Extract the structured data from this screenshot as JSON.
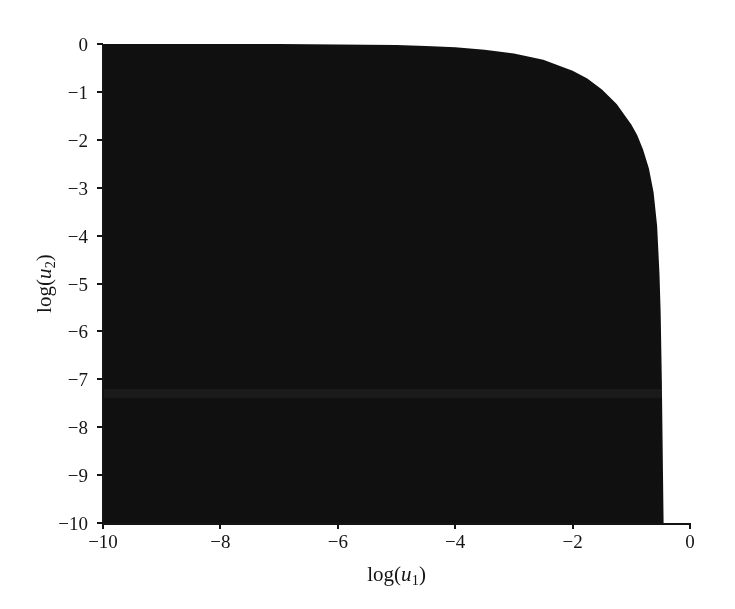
{
  "figure": {
    "background_color": "#ffffff",
    "fill_color": "#0d0d0d",
    "axis_color": "#141414",
    "appearance": "scanned-halftone"
  },
  "axes": {
    "x": {
      "label_prefix": "log(",
      "label_var": "u",
      "label_sub": "1",
      "label_suffix": ")",
      "label_text": "log(u1)",
      "min": -10,
      "max": 0,
      "ticks": [
        -10,
        -8,
        -6,
        -4,
        -2,
        0
      ],
      "tick_labels": [
        "−10",
        "−8",
        "−6",
        "−4",
        "−2",
        "0"
      ]
    },
    "y": {
      "label_prefix": "log(",
      "label_var": "u",
      "label_sub": "2",
      "label_suffix": ")",
      "label_text": "log(u2)",
      "min": -10,
      "max": 0,
      "ticks": [
        0,
        -1,
        -2,
        -3,
        -4,
        -5,
        -6,
        -7,
        -8,
        -9,
        -10
      ],
      "tick_labels": [
        "0",
        "−1",
        "−2",
        "−3",
        "−4",
        "−5",
        "−6",
        "−7",
        "−8",
        "−9",
        "−10"
      ]
    }
  },
  "chart_data": {
    "type": "area",
    "title": "",
    "subtitle": "",
    "xlabel": "log(u1)",
    "ylabel": "log(u2)",
    "xlim": [
      -10,
      0
    ],
    "ylim": [
      -10,
      0
    ],
    "grid": false,
    "legend": null,
    "annotations": [],
    "series": [
      {
        "name": "shaded region",
        "kind": "filled-region",
        "fill": "#0d0d0d",
        "description": "Solid black region occupying the lower-left of the square domain, bounded above and to the right by a convex decreasing boundary curve; the region covers essentially the whole panel except a small wedge in the upper-right corner.",
        "boundary_x": [
          -10.0,
          -9.0,
          -8.0,
          -7.0,
          -6.0,
          -5.0,
          -4.5,
          -4.0,
          -3.5,
          -3.0,
          -2.5,
          -2.0,
          -1.75,
          -1.5,
          -1.25,
          -1.0,
          -0.9,
          -0.8,
          -0.7,
          -0.62,
          -0.56,
          -0.52,
          -0.5,
          -0.48,
          -0.46,
          -0.45
        ],
        "boundary_y": [
          0.0,
          0.0,
          0.0,
          0.0,
          -0.01,
          -0.02,
          -0.04,
          -0.07,
          -0.12,
          -0.2,
          -0.33,
          -0.56,
          -0.72,
          -0.95,
          -1.25,
          -1.68,
          -1.9,
          -2.2,
          -2.6,
          -3.1,
          -3.8,
          -4.8,
          -5.6,
          -7.0,
          -9.0,
          -10.0
        ],
        "fill_below_boundary": true
      }
    ]
  }
}
